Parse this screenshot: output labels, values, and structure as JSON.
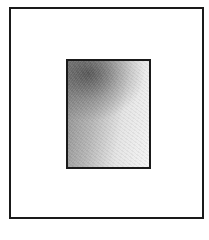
{
  "diagram": {
    "outer_frame": {
      "stroke": "#1a1a1a",
      "fill": "#ffffff"
    },
    "inner_rect": {
      "stroke": "#1a1a1a",
      "fill_style": "gradient",
      "gradient_dark": "#5a5a5a",
      "gradient_light": "#f4f4f4"
    }
  }
}
